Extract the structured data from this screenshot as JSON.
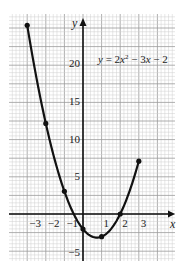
{
  "chart_data": {
    "type": "line",
    "title": "",
    "equation": "y = 2x² − 3x − 2",
    "equation_parts": {
      "y": "y",
      "eq": " = 2",
      "x1": "x",
      "sup": "2",
      "mid": " − 3",
      "x2": "x",
      "tail": " − 2"
    },
    "xlabel": "x",
    "ylabel": "y",
    "xlim": [
      -3.9,
      4.9
    ],
    "ylim": [
      -6.5,
      26
    ],
    "x_ticks": [
      -3,
      -2,
      -1,
      1,
      2,
      3
    ],
    "x_tick_labels": [
      "−3",
      "−2",
      "−1",
      "1",
      "2",
      "3"
    ],
    "y_ticks": [
      20,
      15,
      10,
      5,
      -5
    ],
    "y_tick_labels": [
      "20",
      "15",
      "10",
      "5",
      "−5"
    ],
    "grid": true,
    "legend": null,
    "series": [
      {
        "name": "y = 2x² − 3x − 2",
        "x": [
          -3,
          -2,
          -1,
          0,
          1,
          2,
          3
        ],
        "y": [
          25,
          12,
          3,
          -2,
          -3,
          0,
          7
        ],
        "marker": "dot",
        "curve": "smooth parabola"
      }
    ],
    "colors": {
      "curve": "#111111",
      "axis": "#111111",
      "grid_major": "#9a9a9a",
      "grid_minor": "#cfcfcf",
      "background": "#ffffff"
    }
  }
}
